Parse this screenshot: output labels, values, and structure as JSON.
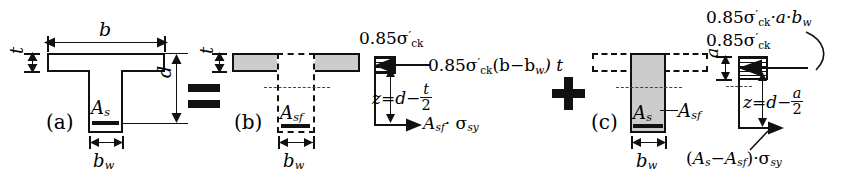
{
  "figure": {
    "equation_operators": {
      "equals": "=",
      "plus": "+"
    }
  },
  "panel_a": {
    "caption": "(a)",
    "labels": {
      "width_top": "b",
      "flange_thickness": "t",
      "effective_depth": "d",
      "web_width": "b",
      "web_width_sub": "w",
      "steel_area": "A",
      "steel_area_sub": "s"
    }
  },
  "panel_b": {
    "caption": "(b)",
    "labels": {
      "flange_thickness": "t",
      "web_width": "b",
      "web_width_sub": "w",
      "flange_steel": "A",
      "flange_steel_sub": "sf"
    },
    "stress_block": {
      "top_stress": "0.85σ",
      "top_stress_sub": "ck",
      "compression_force": "0.85σ",
      "compression_force_sub": "ck",
      "compression_force_rest": "(b−b",
      "compression_force_rest_sub": "w",
      "compression_force_tail": ") t",
      "lever_arm_lhs": "z",
      "lever_arm_eq": "=",
      "lever_arm_d": "d",
      "lever_arm_minus": "−",
      "lever_arm_num": "t",
      "lever_arm_den": "2",
      "tension_force": "A",
      "tension_force_sub": "sf",
      "tension_force_dot": "· σ",
      "tension_force_sub2": "sy"
    }
  },
  "panel_c": {
    "caption": "(c)",
    "labels": {
      "web_width": "b",
      "web_width_sub": "w",
      "steel_area": "A",
      "steel_area_sub": "s",
      "flange_steel": "A",
      "flange_steel_sub": "sf"
    },
    "stress_block": {
      "resultant": "0.85σ",
      "resultant_sub": "ck",
      "resultant_rest": "·a·b",
      "resultant_rest_sub": "w",
      "top_stress": "0.85σ",
      "top_stress_sub": "ck",
      "depth_a": "a",
      "lever_arm_lhs": "z",
      "lever_arm_eq": "=",
      "lever_arm_d": "d",
      "lever_arm_minus": "−",
      "lever_arm_num": "a",
      "lever_arm_den": "2",
      "tension_open": "(A",
      "tension_open_sub": "s",
      "tension_minus": "− A",
      "tension_minus_sub": "sf",
      "tension_close": ")",
      "tension_dot": "·σ",
      "tension_dot_sub": "sy"
    }
  },
  "colors": {
    "stroke": "#111111",
    "fill_gray": "#cccccc",
    "background": "#ffffff"
  }
}
